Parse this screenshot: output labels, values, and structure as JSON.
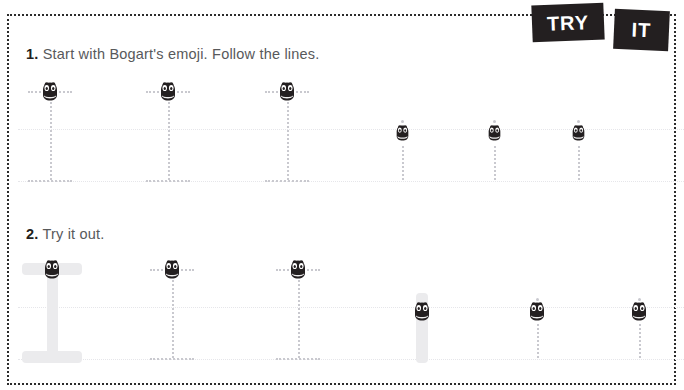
{
  "page": {
    "background_color": "#ffffff",
    "border_style": "dotted",
    "border_color": "#2b2b2b",
    "accent_color": "#231f20",
    "guide_color": "#c9c9cf",
    "ink_color": "#ebebed"
  },
  "badges": [
    {
      "id": "try",
      "label": "TRY"
    },
    {
      "id": "it",
      "label": "IT"
    }
  ],
  "steps": [
    {
      "number": "1.",
      "text": "Start with Bogart's emoji. Follow the lines.",
      "letters": [
        {
          "glyph": "I",
          "style": "capital-i",
          "x": 50,
          "emoji_y": 91
        },
        {
          "glyph": "I",
          "style": "capital-i",
          "x": 168,
          "emoji_y": 91
        },
        {
          "glyph": "I",
          "style": "capital-i",
          "x": 287,
          "emoji_y": 91
        },
        {
          "glyph": "i",
          "style": "lowercase-i",
          "x": 402,
          "emoji_y": 133
        },
        {
          "glyph": "i",
          "style": "lowercase-i",
          "x": 494,
          "emoji_y": 133
        },
        {
          "glyph": "i",
          "style": "lowercase-i",
          "x": 578,
          "emoji_y": 133
        }
      ]
    },
    {
      "number": "2.",
      "text": "Try it out.",
      "letters": [
        {
          "glyph": "I",
          "style": "capital-i",
          "x": 52,
          "emoji_y": 269,
          "traced": true
        },
        {
          "glyph": "I",
          "style": "capital-i",
          "x": 172,
          "emoji_y": 269,
          "traced": false
        },
        {
          "glyph": "I",
          "style": "capital-i",
          "x": 298,
          "emoji_y": 269,
          "traced": false
        },
        {
          "glyph": "i",
          "style": "lowercase-i",
          "x": 422,
          "emoji_y": 311,
          "traced": true
        },
        {
          "glyph": "i",
          "style": "lowercase-i",
          "x": 537,
          "emoji_y": 311,
          "traced": false
        },
        {
          "glyph": "i",
          "style": "lowercase-i",
          "x": 639,
          "emoji_y": 311,
          "traced": false
        }
      ]
    }
  ],
  "emoji": {
    "name": "bogart-emoji",
    "description": "Bogart character face",
    "body_color": "#231f20",
    "eye_color": "#ffffff"
  }
}
